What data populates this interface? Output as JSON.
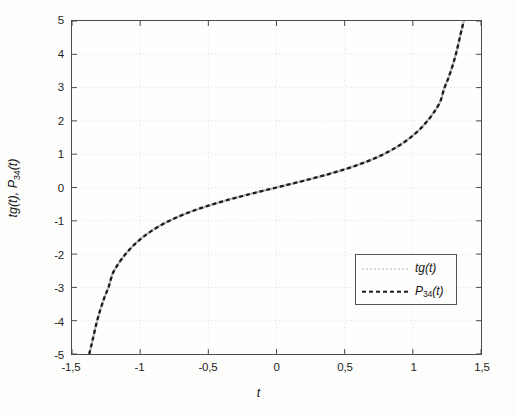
{
  "chart_data": {
    "type": "line",
    "title": "",
    "xlabel": "t",
    "ylabel": "tg(t), P_34(t)",
    "ylabel_parts": {
      "pre": "tg(t), P",
      "sub": "34",
      "post": "(t)"
    },
    "xlim": [
      -1.5,
      1.5
    ],
    "ylim": [
      -5,
      5
    ],
    "grid": true,
    "grid_style": "dotted-faint",
    "legend_position": "lower right",
    "xticks": [
      -1.5,
      -1,
      -0.5,
      0,
      0.5,
      1,
      1.5
    ],
    "xtick_labels": [
      "-1,5",
      "-1",
      "-0,5",
      "0",
      "0,5",
      "1",
      "1,5"
    ],
    "yticks": [
      -5,
      -4,
      -3,
      -2,
      -1,
      0,
      1,
      2,
      3,
      4,
      5
    ],
    "ytick_labels": [
      "-5",
      "-4",
      "-3",
      "-2",
      "-1",
      "0",
      "1",
      "2",
      "3",
      "4",
      "5"
    ],
    "decimal_separator": ",",
    "series": [
      {
        "name": "tg(t)",
        "name_parts": {
          "pre": "tg(t)",
          "sub": "",
          "post": ""
        },
        "style": "solid-thin",
        "color": "#b9b9b9",
        "x": [
          -1.3734,
          -1.35,
          -1.32,
          -1.29,
          -1.26,
          -1.23,
          -1.2,
          -1.15,
          -1.1,
          -1.05,
          -1.0,
          -0.95,
          -0.9,
          -0.85,
          -0.8,
          -0.75,
          -0.7,
          -0.65,
          -0.6,
          -0.55,
          -0.5,
          -0.45,
          -0.4,
          -0.35,
          -0.3,
          -0.25,
          -0.2,
          -0.15,
          -0.1,
          -0.05,
          0,
          0.05,
          0.1,
          0.15,
          0.2,
          0.25,
          0.3,
          0.35,
          0.4,
          0.45,
          0.5,
          0.55,
          0.6,
          0.65,
          0.7,
          0.75,
          0.8,
          0.85,
          0.9,
          0.95,
          1.0,
          1.05,
          1.1,
          1.15,
          1.2,
          1.23,
          1.26,
          1.29,
          1.32,
          1.35,
          1.3734
        ],
        "y": [
          -5.0,
          -4.6,
          -4.07,
          -3.64,
          -3.28,
          -2.97,
          -2.57,
          -2.23,
          -1.965,
          -1.743,
          -1.557,
          -1.398,
          -1.26,
          -1.138,
          -1.03,
          -0.932,
          -0.842,
          -0.76,
          -0.684,
          -0.613,
          -0.546,
          -0.483,
          -0.423,
          -0.365,
          -0.309,
          -0.255,
          -0.203,
          -0.151,
          -0.1,
          -0.05,
          0,
          0.05,
          0.1,
          0.151,
          0.203,
          0.255,
          0.309,
          0.365,
          0.423,
          0.483,
          0.546,
          0.613,
          0.684,
          0.76,
          0.842,
          0.932,
          1.03,
          1.138,
          1.26,
          1.398,
          1.557,
          1.743,
          1.965,
          2.23,
          2.57,
          2.97,
          3.28,
          3.64,
          4.07,
          4.6,
          5.0
        ]
      },
      {
        "name": "P_34(t)",
        "name_parts": {
          "pre": "P",
          "sub": "34",
          "post": "(t)"
        },
        "style": "dashed-thick",
        "color": "#1a1a1a",
        "x": [
          -1.3734,
          -1.35,
          -1.32,
          -1.29,
          -1.26,
          -1.23,
          -1.2,
          -1.15,
          -1.1,
          -1.05,
          -1.0,
          -0.95,
          -0.9,
          -0.85,
          -0.8,
          -0.75,
          -0.7,
          -0.65,
          -0.6,
          -0.55,
          -0.5,
          -0.45,
          -0.4,
          -0.35,
          -0.3,
          -0.25,
          -0.2,
          -0.15,
          -0.1,
          -0.05,
          0,
          0.05,
          0.1,
          0.15,
          0.2,
          0.25,
          0.3,
          0.35,
          0.4,
          0.45,
          0.5,
          0.55,
          0.6,
          0.65,
          0.7,
          0.75,
          0.8,
          0.85,
          0.9,
          0.95,
          1.0,
          1.05,
          1.1,
          1.15,
          1.2,
          1.23,
          1.26,
          1.29,
          1.32,
          1.35,
          1.3734
        ],
        "y": [
          -5.0,
          -4.6,
          -4.07,
          -3.64,
          -3.28,
          -2.97,
          -2.57,
          -2.23,
          -1.965,
          -1.743,
          -1.557,
          -1.398,
          -1.26,
          -1.138,
          -1.03,
          -0.932,
          -0.842,
          -0.76,
          -0.684,
          -0.613,
          -0.546,
          -0.483,
          -0.423,
          -0.365,
          -0.309,
          -0.255,
          -0.203,
          -0.151,
          -0.1,
          -0.05,
          0,
          0.05,
          0.1,
          0.151,
          0.203,
          0.255,
          0.309,
          0.365,
          0.423,
          0.483,
          0.546,
          0.613,
          0.684,
          0.76,
          0.842,
          0.932,
          1.03,
          1.138,
          1.26,
          1.398,
          1.557,
          1.743,
          1.965,
          2.23,
          2.57,
          2.97,
          3.28,
          3.64,
          4.07,
          4.6,
          5.0
        ]
      }
    ],
    "annotations": []
  }
}
